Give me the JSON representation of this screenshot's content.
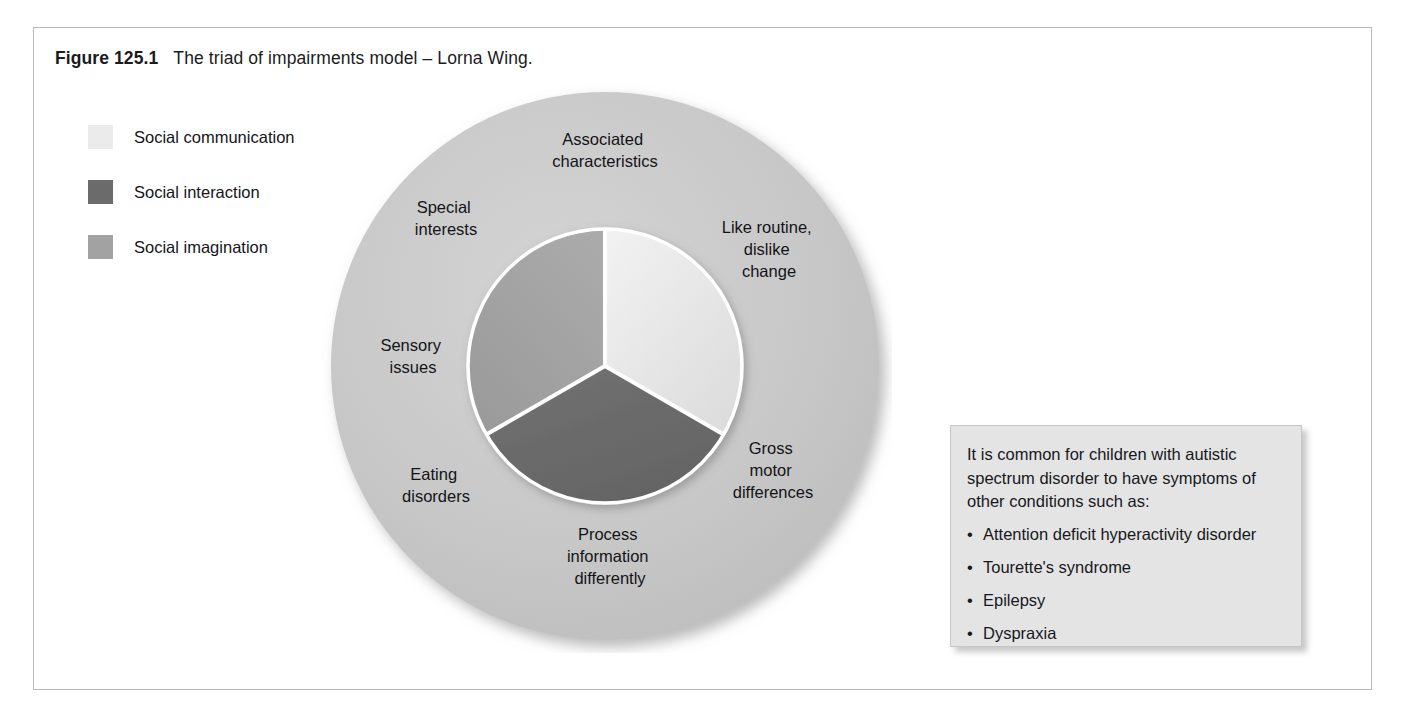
{
  "caption": {
    "label": "Figure 125.1",
    "text": "The triad of impairments model – Lorna Wing."
  },
  "legend": {
    "items": [
      {
        "label": "Social communication",
        "color": "#ebebeb"
      },
      {
        "label": "Social interaction",
        "color": "#6b6b6b"
      },
      {
        "label": "Social imagination",
        "color": "#a2a2a2"
      }
    ]
  },
  "diagram": {
    "outer_ring_color": "#c9c9c9",
    "divider_color": "#ffffff",
    "outer_labels": [
      {
        "id": "associated-characteristics",
        "lines": [
          "Associated",
          "characteristics"
        ]
      },
      {
        "id": "like-routine-dislike-change",
        "lines": [
          "Like routine,",
          "dislike",
          "change"
        ]
      },
      {
        "id": "gross-motor-differences",
        "lines": [
          "Gross",
          "motor",
          "differences"
        ]
      },
      {
        "id": "process-information-differently",
        "lines": [
          "Process",
          "information",
          "differently"
        ]
      },
      {
        "id": "eating-disorders",
        "lines": [
          "Eating",
          "disorders"
        ]
      },
      {
        "id": "sensory-issues",
        "lines": [
          "Sensory",
          "issues"
        ]
      },
      {
        "id": "special-interests",
        "lines": [
          "Special",
          "interests"
        ]
      }
    ],
    "sectors": [
      {
        "id": "social-communication",
        "label": "Social communication",
        "color": "#ebebeb",
        "start_deg": 0,
        "end_deg": 120
      },
      {
        "id": "social-interaction",
        "label": "Social interaction",
        "color": "#6b6b6b",
        "start_deg": 120,
        "end_deg": 240
      },
      {
        "id": "social-imagination",
        "label": "Social imagination",
        "color": "#a2a2a2",
        "start_deg": 240,
        "end_deg": 360
      }
    ]
  },
  "callout": {
    "intro": "It is common for children with autistic spectrum disorder to have symptoms of other conditions such as:",
    "items": [
      "Attention deficit hyperactivity disorder",
      "Tourette's syndrome",
      "Epilepsy",
      "Dyspraxia"
    ]
  }
}
